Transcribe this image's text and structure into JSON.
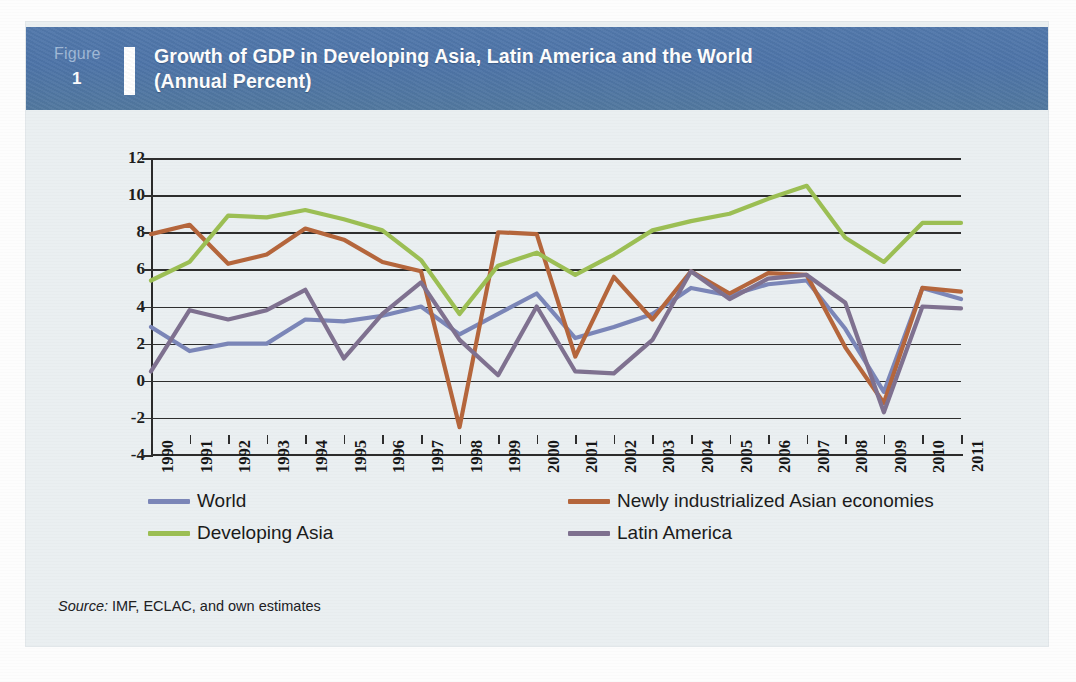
{
  "header": {
    "figure_word": "Figure",
    "figure_number": "1",
    "title_line1": "Growth of GDP in Developing Asia, Latin America and the World",
    "title_line2": "(Annual Percent)",
    "band_color": "#4e74a8"
  },
  "source": {
    "label": "Source:",
    "text": " IMF, ECLAC, and own estimates"
  },
  "legend": [
    {
      "label": "World",
      "color": "#7b86b8"
    },
    {
      "label": "Newly industrialized Asian economies",
      "color": "#b5663c"
    },
    {
      "label": "Developing Asia",
      "color": "#9cbf54"
    },
    {
      "label": "Latin America",
      "color": "#7f7190"
    }
  ],
  "chart_data": {
    "type": "line",
    "title": "Growth of GDP in Developing Asia, Latin America and the World (Annual Percent)",
    "xlabel": "",
    "ylabel": "",
    "ylim": [
      -4,
      12
    ],
    "ytick_step": 2,
    "yticks": [
      "12",
      "10",
      "8",
      "6",
      "4",
      "2",
      "0",
      "-2",
      "-4"
    ],
    "grid": true,
    "legend_position": "bottom",
    "categories": [
      "1990",
      "1991",
      "1992",
      "1993",
      "1994",
      "1995",
      "1996",
      "1997",
      "1998",
      "1999",
      "2000",
      "2001",
      "2002",
      "2003",
      "2004",
      "2005",
      "2006",
      "2007",
      "2008",
      "2009",
      "2010",
      "2011"
    ],
    "series": [
      {
        "name": "World",
        "color": "#7b86b8",
        "values": [
          2.9,
          1.6,
          2.0,
          2.0,
          3.3,
          3.2,
          3.5,
          4.0,
          2.5,
          3.6,
          4.7,
          2.3,
          2.9,
          3.6,
          5.0,
          4.6,
          5.2,
          5.4,
          2.8,
          -0.6,
          5.0,
          4.4
        ]
      },
      {
        "name": "Newly industrialized Asian economies",
        "color": "#b5663c",
        "values": [
          7.9,
          8.4,
          6.3,
          6.8,
          8.2,
          7.6,
          6.4,
          5.9,
          -2.5,
          8.0,
          7.9,
          1.3,
          5.6,
          3.3,
          5.9,
          4.7,
          5.8,
          5.7,
          1.8,
          -1.2,
          5.0,
          4.8
        ]
      },
      {
        "name": "Developing Asia",
        "color": "#9cbf54",
        "values": [
          5.4,
          6.4,
          8.9,
          8.8,
          9.2,
          8.7,
          8.1,
          6.5,
          3.6,
          6.2,
          6.9,
          5.7,
          6.8,
          8.1,
          8.6,
          9.0,
          9.8,
          10.5,
          7.7,
          6.4,
          8.5,
          8.5
        ]
      },
      {
        "name": "Latin America",
        "color": "#7f7190",
        "values": [
          0.5,
          3.8,
          3.3,
          3.8,
          4.9,
          1.2,
          3.6,
          5.3,
          2.2,
          0.3,
          4.0,
          0.5,
          0.4,
          2.2,
          5.9,
          4.4,
          5.5,
          5.7,
          4.2,
          -1.7,
          4.0,
          3.9
        ]
      }
    ]
  }
}
